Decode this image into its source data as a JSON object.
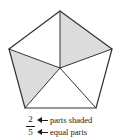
{
  "figure": {
    "shape": "pentagon",
    "total_parts": 5,
    "shaded_parts": 2,
    "colors": {
      "outline": "#333333",
      "shaded_fill": "#dcdcdc",
      "unshaded_fill": "#ffffff",
      "text": "#1a1a1a"
    },
    "parts": [
      {
        "id": "part-top-left",
        "shaded": false
      },
      {
        "id": "part-top-right",
        "shaded": true
      },
      {
        "id": "part-bottom-right",
        "shaded": false
      },
      {
        "id": "part-bottom-left",
        "shaded": false
      },
      {
        "id": "part-left",
        "shaded": true
      }
    ]
  },
  "labels": {
    "fraction": {
      "numerator": "2",
      "denominator": "5"
    },
    "numerator_caption": "parts shaded",
    "denominator_caption": "equal parts",
    "arrow_icon": "left-arrow-icon"
  }
}
